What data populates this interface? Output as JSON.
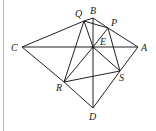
{
  "diagram": {
    "points": {
      "A": {
        "label": "A",
        "x": 138,
        "y": 47
      },
      "B": {
        "label": "B",
        "x": 93,
        "y": 18
      },
      "C": {
        "label": "C",
        "x": 22,
        "y": 47
      },
      "D": {
        "label": "D",
        "x": 93,
        "y": 108
      },
      "E": {
        "label": "E",
        "x": 93,
        "y": 47
      },
      "P": {
        "label": "P",
        "x": 108,
        "y": 28
      },
      "Q": {
        "label": "Q",
        "x": 84,
        "y": 21
      },
      "R": {
        "label": "R",
        "x": 64,
        "y": 82
      },
      "S": {
        "label": "S",
        "x": 120,
        "y": 71
      }
    },
    "segments": [
      [
        "C",
        "Q"
      ],
      [
        "Q",
        "B"
      ],
      [
        "B",
        "P"
      ],
      [
        "P",
        "A"
      ],
      [
        "C",
        "A"
      ],
      [
        "C",
        "R"
      ],
      [
        "R",
        "D"
      ],
      [
        "D",
        "S"
      ],
      [
        "S",
        "A"
      ],
      [
        "B",
        "E"
      ],
      [
        "E",
        "D"
      ],
      [
        "Q",
        "R"
      ],
      [
        "Q",
        "E"
      ],
      [
        "Q",
        "P"
      ],
      [
        "P",
        "E"
      ],
      [
        "P",
        "S"
      ],
      [
        "E",
        "R"
      ],
      [
        "E",
        "S"
      ],
      [
        "R",
        "S"
      ]
    ],
    "line_color": "#222222"
  }
}
